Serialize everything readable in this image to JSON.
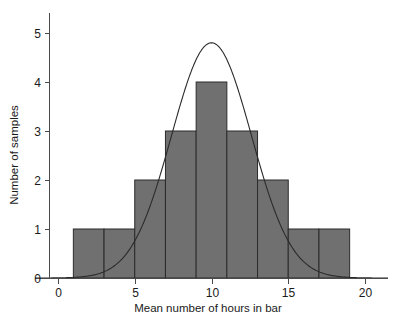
{
  "chart_data": {
    "type": "bar",
    "title": "",
    "subtitle": "",
    "xlabel": "Mean number of hours in bar",
    "ylabel": "Number of samples",
    "xlim": [
      -1.5,
      21.5
    ],
    "ylim": [
      0,
      5.4
    ],
    "xticks": [
      0,
      5,
      10,
      15,
      20
    ],
    "xtick_labels": [
      "0",
      "5",
      "10",
      "15",
      "20"
    ],
    "yticks": [
      0,
      1,
      2,
      3,
      4,
      5
    ],
    "ytick_labels": [
      "0",
      "1",
      "2",
      "3",
      "4",
      "5"
    ],
    "grid": false,
    "legend": "none",
    "bin_width": 2,
    "bin_edges": [
      1,
      3,
      5,
      7,
      9,
      11,
      13,
      15,
      17,
      19
    ],
    "categories": [
      "1-3",
      "3-5",
      "5-7",
      "7-9",
      "9-11",
      "11-13",
      "13-15",
      "15-17",
      "17-19"
    ],
    "bin_centers": [
      2,
      4,
      6,
      8,
      10,
      12,
      14,
      16,
      18
    ],
    "values": [
      1,
      1,
      2,
      3,
      4,
      3,
      2,
      1,
      1
    ],
    "bar_color": "#707070",
    "bar_edge_color": "#2b2b2b",
    "overlay": {
      "type": "line",
      "name": "normal curve",
      "mean": 10,
      "sigma": 2.6,
      "peak": 4.8,
      "color": "#2b2b2b"
    }
  },
  "axes": {
    "y_axis_title": "Number of samples",
    "x_axis_title": "Mean number of hours in bar"
  },
  "colors": {
    "background": "#ffffff",
    "bar_fill": "#707070",
    "line": "#2b2b2b",
    "axis": "#4a4a4a",
    "text": "#1a1a1a"
  }
}
